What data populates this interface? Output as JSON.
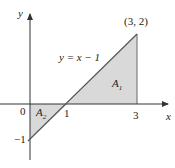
{
  "figure": {
    "axes": {
      "x_label": "x",
      "y_label": "y",
      "origin_label": "0",
      "ticks": {
        "x1": "1",
        "x3": "3",
        "yneg1": "−1"
      }
    },
    "line": {
      "equation": "y = x − 1"
    },
    "point": {
      "label": "(3, 2)"
    },
    "regions": [
      {
        "name": "A",
        "subscript": "1"
      },
      {
        "name": "A",
        "subscript": "2"
      }
    ],
    "colors": {
      "fill": "#d9d9d9",
      "line": "#555555",
      "axis": "#333333"
    }
  }
}
